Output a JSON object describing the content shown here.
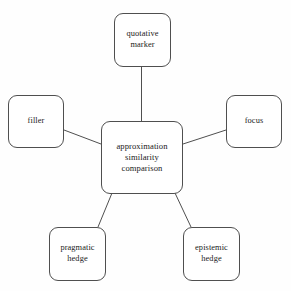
{
  "diagram": {
    "type": "radial-concept-map",
    "background_color": "#fefefe",
    "border_color": "#4f4f4f",
    "text_color": "#1a1a1a",
    "center": {
      "id": "center",
      "label": "approximation\nsimilarity\ncomparison",
      "lines": [
        "approximation",
        "similarity",
        "comparison"
      ]
    },
    "nodes": [
      {
        "id": "quotative",
        "label": "quotative\nmarker",
        "lines": [
          "quotative",
          "marker"
        ],
        "position": "top"
      },
      {
        "id": "filler",
        "label": "filler",
        "lines": [
          "filler"
        ],
        "position": "left"
      },
      {
        "id": "focus",
        "label": "focus",
        "lines": [
          "focus"
        ],
        "position": "right"
      },
      {
        "id": "pragmatic",
        "label": "pragmatic\nhedge",
        "lines": [
          "pragmatic",
          "hedge"
        ],
        "position": "bottom-left"
      },
      {
        "id": "epistemic",
        "label": "epistemic\nhedge",
        "lines": [
          "epistemic",
          "hedge"
        ],
        "position": "bottom-right"
      }
    ],
    "edges": [
      {
        "from": "quotative",
        "to": "center"
      },
      {
        "from": "filler",
        "to": "center"
      },
      {
        "from": "focus",
        "to": "center"
      },
      {
        "from": "pragmatic",
        "to": "center"
      },
      {
        "from": "epistemic",
        "to": "center"
      }
    ]
  }
}
